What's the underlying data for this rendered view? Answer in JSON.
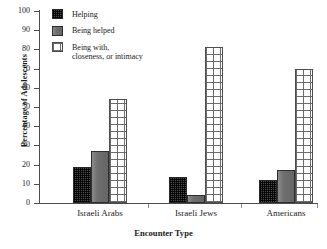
{
  "chart_data": {
    "type": "bar",
    "title": "",
    "subtitle": "",
    "xlabel": "Encounter Type",
    "ylabel": "Percentage of Adolescents",
    "categories": [
      "Israeli Arabs",
      "Israeli Jews",
      "Americans"
    ],
    "series": [
      {
        "name": "Helping",
        "values": [
          19,
          13.5,
          12
        ],
        "pattern": "dark-checkered",
        "color": "#4a4a4a"
      },
      {
        "name": "Being helped",
        "values": [
          27,
          4,
          17
        ],
        "pattern": "solid-gray",
        "color": "#6f6f6f"
      },
      {
        "name": "Being with,\nclosenesss, or intimacy",
        "values": [
          54,
          81.5,
          70
        ],
        "pattern": "white-grid",
        "color": "#ffffff"
      }
    ],
    "ylim": [
      0,
      100
    ],
    "yticks": [
      0,
      10,
      20,
      30,
      40,
      50,
      60,
      70,
      80,
      90,
      100
    ],
    "ytick_labels": [
      "0",
      "10",
      "20",
      "30",
      "40",
      "50",
      "60",
      "70",
      "80",
      "90",
      "100"
    ],
    "grid": false,
    "legend_position": "upper-left-inside",
    "legend": [
      {
        "label": "Helping"
      },
      {
        "label_line1": "Being helped",
        "label": "Being helped"
      },
      {
        "label_line1": "Being with,",
        "label_line2": "closeness, or intimacy",
        "label": "Being with, closeness, or intimacy"
      }
    ]
  }
}
